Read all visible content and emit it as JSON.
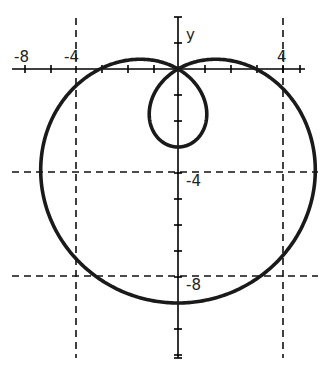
{
  "chart_data": {
    "type": "line",
    "title": "",
    "equation": "r = 3 - 6 sin(θ)",
    "xlabel": "",
    "ylabel": "y",
    "x_tick_labels": [
      {
        "text": "-8",
        "px": 26
      },
      {
        "text": "-4",
        "px": 76
      },
      {
        "text": "4",
        "px": 283
      }
    ],
    "y_tick_labels": [
      {
        "text": "-4",
        "value": -4
      },
      {
        "text": "-8",
        "value": -8
      }
    ],
    "xlim": [
      -6.5,
      5
    ],
    "ylim": [
      -11,
      2
    ],
    "grid": "dashed lines at x=-4, x=4, y=-4, y=-8",
    "key_points": [
      {
        "label": "outer bottom",
        "x": 0,
        "y": -9
      },
      {
        "label": "inner loop bottom",
        "x": 0,
        "y": -3
      },
      {
        "label": "pole (self-intersection)",
        "x": 0,
        "y": 0
      },
      {
        "label": "outer left extreme",
        "x": -5.3,
        "y": -4.3
      },
      {
        "label": "outer right extreme",
        "x": 5.3,
        "y": -4.3
      },
      {
        "label": "x-intercepts",
        "x": [
          -3,
          3
        ],
        "y": 0
      }
    ],
    "series": [
      {
        "name": "r = 3 - 6 sin θ",
        "theta_range": [
          0,
          6.2832
        ],
        "color": "#1a1a1a"
      }
    ],
    "axis_color": "#000000",
    "curve_color": "#1a1a1a",
    "grid_color": "#111111"
  },
  "labels": {
    "y_axis": "y",
    "x_neg8": "-8",
    "x_neg4": "-4",
    "x_pos4": "4",
    "y_neg4": "-4",
    "y_neg8": "-8"
  }
}
